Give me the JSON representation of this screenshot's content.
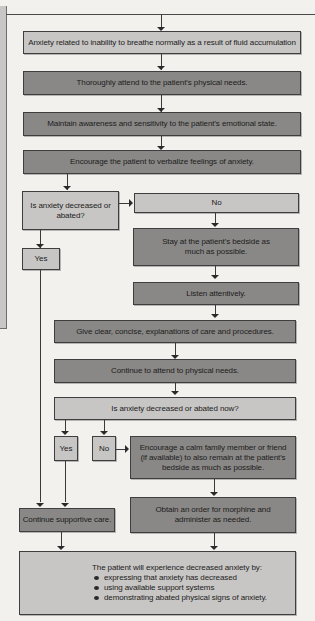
{
  "flowchart": {
    "nursing_diagnosis": "Anxiety related to inability to breathe normally as a result of fluid accumulation",
    "interventions": [
      "Thoroughly attend to the patient's physical needs.",
      "Maintain awareness and sensitivity to the patient's emotional state.",
      "Encourage the patient to verbalize feelings of anxiety."
    ],
    "decision_1": {
      "question": "Is anxiety decreased or abated?",
      "yes_label": "Yes",
      "no_label": "No"
    },
    "no_branch_1": [
      "Stay at the patient's bedside as much as possible.",
      "Listen attentively."
    ],
    "continued_interventions": [
      "Give clear, concise, explanations of care and procedures.",
      "Continue to attend to physical needs."
    ],
    "decision_2": {
      "question": "Is anxiety decreased or abated now?",
      "yes_label": "Yes",
      "no_label": "No"
    },
    "no_branch_2": [
      "Encourage a calm family member or friend (if available) to also remain at the patient's bedside as much as possible.",
      "Obtain an order for morphine and administer as needed."
    ],
    "continue_care": "Continue supportive care.",
    "outcome": {
      "intro": "The patient will experience decreased anxiety by:",
      "bullets": [
        "expressing that anxiety has decreased",
        "using available support systems",
        "demonstrating abated physical signs of anxiety."
      ]
    },
    "colors": {
      "light_box": "#c8c6c4",
      "dark_box": "#8a8886",
      "background": "#f3f1ee",
      "lines": "#3a3a3a"
    }
  }
}
